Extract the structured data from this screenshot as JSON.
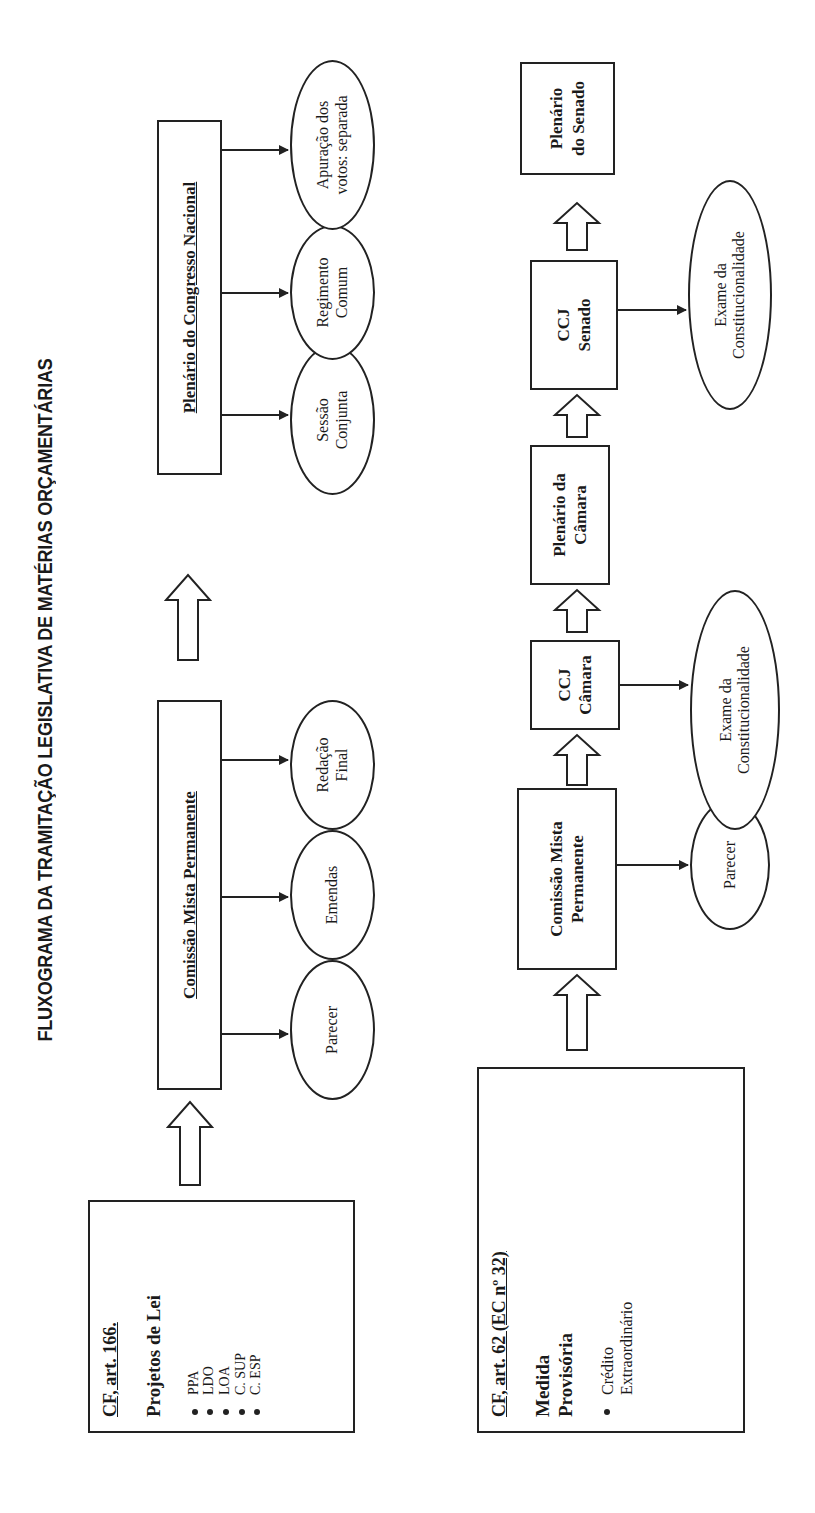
{
  "title": "FLUXOGRAMA DA TRAMITAÇÃO LEGISLATIVA DE MATÉRIAS ORÇAMENTÁRIAS",
  "top_flow": {
    "source": {
      "heading": "CF, art. 166.",
      "subtitle": "Projetos de Lei",
      "items": [
        "PPA",
        "LDO",
        "LOA",
        "C. SUP",
        "C. ESP"
      ]
    },
    "committee": {
      "label": "Comissão Mista Permanente",
      "outputs": [
        "Parecer",
        "Emendas",
        "Redação Final"
      ]
    },
    "plenary": {
      "label": "Plenário do Congresso Nacional",
      "outputs": [
        "Sessão Conjunta",
        "Regimento Comum",
        "Apuração dos votos: separada"
      ]
    }
  },
  "bottom_flow": {
    "source": {
      "heading": "CF, art. 62 (EC nº 32)",
      "subtitle": "Medida Provisória",
      "items": [
        "Crédito Extraordinário"
      ]
    },
    "committee": {
      "label_line1": "Comissão Mista",
      "label_line2": "Permanente",
      "output": "Parecer"
    },
    "ccj_camara": {
      "label_line1": "CCJ",
      "label_line2": "Câmara",
      "output_line1": "Exame da",
      "output_line2": "Constitucionalidade"
    },
    "plenario_camara": {
      "label_line1": "Plenário da",
      "label_line2": "Câmara"
    },
    "ccj_senado": {
      "label_line1": "CCJ",
      "label_line2": "Senado",
      "output_line1": "Exame da",
      "output_line2": "Constitucionalidade"
    },
    "plenario_senado": {
      "label_line1": "Plenário",
      "label_line2": "do Senado"
    }
  }
}
